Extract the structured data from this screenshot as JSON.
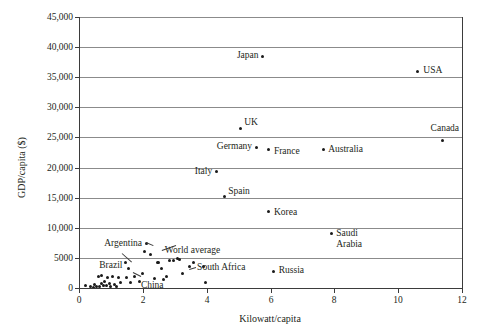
{
  "chart_data": {
    "type": "scatter",
    "title": "",
    "xlabel": "Kilowatt/capita",
    "ylabel": "GDP/capita ($)",
    "xlim": [
      0,
      12
    ],
    "ylim": [
      0,
      45000
    ],
    "xticks": [
      "0",
      "2",
      "4",
      "6",
      "8",
      "10",
      "12"
    ],
    "xtick_values": [
      0,
      2,
      4,
      6,
      8,
      10,
      12
    ],
    "yticks": [
      "0",
      "5000",
      "10,000",
      "15,000",
      "20,000",
      "25,000",
      "30,000",
      "35,000",
      "40,000",
      "45,000"
    ],
    "ytick_values": [
      0,
      5000,
      10000,
      15000,
      20000,
      25000,
      30000,
      35000,
      40000,
      45000
    ],
    "grid": "horizontal",
    "legend": "none",
    "labeled_points": [
      {
        "name": "Japan",
        "x": 5.75,
        "y": 38500,
        "label_side": "left"
      },
      {
        "name": "USA",
        "x": 10.6,
        "y": 36000,
        "label_side": "right"
      },
      {
        "name": "Canada",
        "x": 11.4,
        "y": 24500,
        "label_side": "above"
      },
      {
        "name": "UK",
        "x": 5.05,
        "y": 26500,
        "label_side": "right"
      },
      {
        "name": "Germany",
        "x": 5.55,
        "y": 23400,
        "label_side": "left"
      },
      {
        "name": "France",
        "x": 5.95,
        "y": 23000,
        "label_side": "right"
      },
      {
        "name": "Australia",
        "x": 7.65,
        "y": 23000,
        "label_side": "right"
      },
      {
        "name": "Italy",
        "x": 4.3,
        "y": 19300,
        "label_side": "left"
      },
      {
        "name": "Spain",
        "x": 4.55,
        "y": 15200,
        "label_side": "right"
      },
      {
        "name": "Korea",
        "x": 5.95,
        "y": 12700,
        "label_side": "right"
      },
      {
        "name": "Saudi Arabia",
        "x": 7.9,
        "y": 9000,
        "label_side": "right"
      },
      {
        "name": "Argentina",
        "x": 2.1,
        "y": 7400,
        "label_side": "left"
      },
      {
        "name": "World average",
        "x": 2.25,
        "y": 5600,
        "label_side": "right"
      },
      {
        "name": "Brazil",
        "x": 1.55,
        "y": 3300,
        "label_side": "left"
      },
      {
        "name": "China",
        "x": 2.65,
        "y": 1400,
        "label_side": "left"
      },
      {
        "name": "South Africa",
        "x": 3.45,
        "y": 3500,
        "label_side": "right"
      },
      {
        "name": "Russia",
        "x": 6.1,
        "y": 2800,
        "label_side": "right"
      }
    ],
    "unlabeled_points": [
      {
        "x": 0.2,
        "y": 400
      },
      {
        "x": 0.35,
        "y": 200
      },
      {
        "x": 0.45,
        "y": 150
      },
      {
        "x": 0.5,
        "y": 600
      },
      {
        "x": 0.55,
        "y": 300
      },
      {
        "x": 0.6,
        "y": 1900
      },
      {
        "x": 0.65,
        "y": 250
      },
      {
        "x": 0.7,
        "y": 700
      },
      {
        "x": 0.72,
        "y": 2100
      },
      {
        "x": 0.78,
        "y": 450
      },
      {
        "x": 0.8,
        "y": 1100
      },
      {
        "x": 0.85,
        "y": 350
      },
      {
        "x": 0.9,
        "y": 1800
      },
      {
        "x": 0.95,
        "y": 800
      },
      {
        "x": 1.0,
        "y": 300
      },
      {
        "x": 1.05,
        "y": 1900
      },
      {
        "x": 1.12,
        "y": 600
      },
      {
        "x": 1.18,
        "y": 250
      },
      {
        "x": 1.25,
        "y": 1700
      },
      {
        "x": 1.3,
        "y": 900
      },
      {
        "x": 1.45,
        "y": 4200
      },
      {
        "x": 1.5,
        "y": 1800
      },
      {
        "x": 1.6,
        "y": 900
      },
      {
        "x": 1.75,
        "y": 1900
      },
      {
        "x": 1.9,
        "y": 1000
      },
      {
        "x": 2.0,
        "y": 2400
      },
      {
        "x": 2.05,
        "y": 6000
      },
      {
        "x": 2.35,
        "y": 1600
      },
      {
        "x": 2.45,
        "y": 4200
      },
      {
        "x": 2.5,
        "y": 4300
      },
      {
        "x": 2.6,
        "y": 3200
      },
      {
        "x": 2.75,
        "y": 1900
      },
      {
        "x": 2.85,
        "y": 4600
      },
      {
        "x": 2.95,
        "y": 4550
      },
      {
        "x": 3.1,
        "y": 4900
      },
      {
        "x": 3.15,
        "y": 4800
      },
      {
        "x": 3.25,
        "y": 2400
      },
      {
        "x": 3.6,
        "y": 4300
      },
      {
        "x": 3.9,
        "y": 3500
      },
      {
        "x": 3.95,
        "y": 900
      }
    ]
  }
}
